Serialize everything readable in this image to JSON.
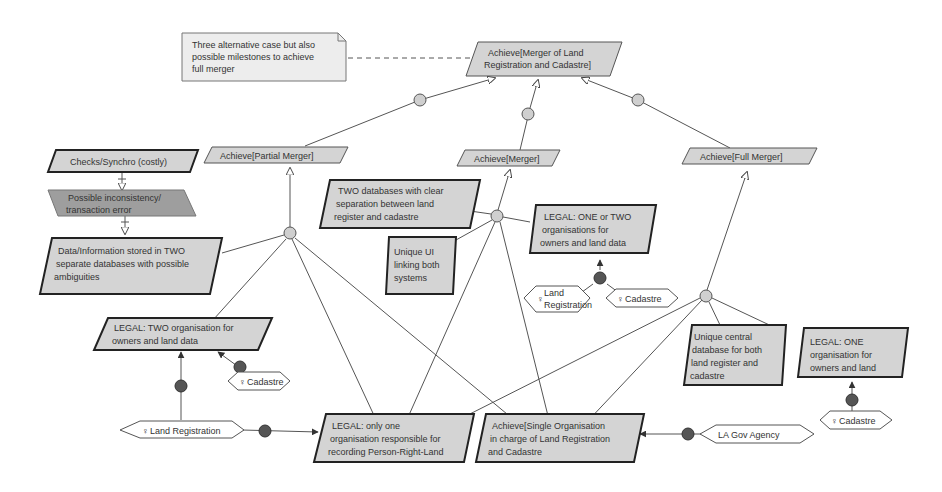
{
  "diagram": {
    "colors": {
      "node_fill": "#d4d4d4",
      "node_dark_fill": "#9e9e9e",
      "stroke": "#444444",
      "thick_stroke": "#222222",
      "decomp_fill": "#cfcfcf",
      "contrib_fill": "#555555",
      "note_fill": "#ededed",
      "agent_fill": "#ffffff"
    },
    "note": {
      "lines": [
        "Three alternative case but also",
        "possible milestones to achieve",
        "full merger"
      ]
    },
    "goals": {
      "top": {
        "lines": [
          "Achieve[Merger of Land",
          "Registration and Cadastre]"
        ]
      },
      "partial": {
        "lines": [
          "Achieve[Partial Merger]"
        ]
      },
      "merger": {
        "lines": [
          "Achieve[Merger]"
        ]
      },
      "full": {
        "lines": [
          "Achieve[Full Merger]"
        ]
      },
      "single_org": {
        "lines": [
          "Achieve[Single Organisation",
          "in charge of Land Registration",
          "and Cadastre"
        ]
      }
    },
    "obstacles": {
      "checks": {
        "lines": [
          "Checks/Synchro (costly)"
        ]
      },
      "inconsistency": {
        "lines": [
          "Possible inconsistency/",
          "transaction error"
        ]
      }
    },
    "expectations": {
      "two_db_ambiguous": {
        "lines": [
          "Data/Information stored in TWO",
          "separate databases with possible",
          "ambiguities"
        ]
      },
      "two_db_clear": {
        "lines": [
          "TWO databases with clear",
          "separation between land",
          "register and cadastre"
        ]
      },
      "unique_ui": {
        "lines": [
          "Unique UI",
          "linking both",
          "systems"
        ]
      },
      "legal_one_or_two": {
        "lines": [
          "LEGAL: ONE or TWO",
          "organisations for",
          "owners and land data"
        ]
      },
      "legal_two": {
        "lines": [
          "LEGAL: TWO organisation for",
          "owners and land data"
        ]
      },
      "unique_central_db": {
        "lines": [
          "Unique central",
          "database for both",
          "land register and",
          "cadastre"
        ]
      },
      "legal_one": {
        "lines": [
          "LEGAL: ONE",
          "organisation for",
          "owners and land"
        ]
      },
      "legal_only_one": {
        "lines": [
          "LEGAL: only one",
          "organisation responsible for",
          "recording Person-Right-Land"
        ]
      }
    },
    "agents": {
      "land_registration_mid": {
        "lines": [
          "Land",
          "Registration"
        ]
      },
      "cadastre_mid": {
        "lines": [
          "Cadastre"
        ]
      },
      "cadastre_left": {
        "lines": [
          "Cadastre"
        ]
      },
      "land_registration_bottom": {
        "lines": [
          "Land Registration"
        ]
      },
      "cadastre_right": {
        "lines": [
          "Cadastre"
        ]
      },
      "la_gov_agency": {
        "lines": [
          "LA Gov Agency"
        ]
      }
    }
  }
}
